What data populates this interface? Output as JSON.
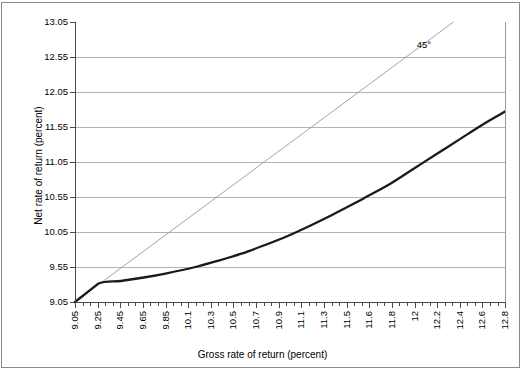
{
  "chart_data": {
    "type": "line",
    "title": "",
    "xlabel": "Gross rate of return (percent)",
    "ylabel": "Net rate of return (percent)",
    "xlim": [
      9.05,
      12.8
    ],
    "ylim": [
      9.05,
      13.05
    ],
    "grid": true,
    "legend": "none",
    "x_tick_labels": [
      "9.05",
      "9.25",
      "9.45",
      "9.65",
      "9.85",
      "10.1",
      "10.3",
      "10.5",
      "10.7",
      "10.9",
      "11.1",
      "11.3",
      "11.5",
      "11.6",
      "11.8",
      "12",
      "12.2",
      "12.4",
      "12.6",
      "12.8"
    ],
    "y_tick_labels": [
      "9.05",
      "9.55",
      "10.05",
      "10.55",
      "11.05",
      "11.55",
      "12.05",
      "12.55",
      "13.05"
    ],
    "annotations": [
      {
        "text": "45°",
        "x": 12.03,
        "y": 12.72,
        "name": "forty-five-degree-label"
      }
    ],
    "series": [
      {
        "name": "45-degree reference line",
        "style": "thin-gray",
        "color": "#9a9a9a",
        "x": [
          9.05,
          12.35
        ],
        "y": [
          9.05,
          13.05
        ]
      },
      {
        "name": "Net rate of return curve",
        "style": "thick-black",
        "color": "#1a1a1a",
        "x": [
          9.05,
          9.25,
          9.45,
          9.65,
          9.85,
          10.1,
          10.3,
          10.5,
          10.7,
          10.9,
          11.1,
          11.3,
          11.5,
          11.6,
          11.8,
          12.0,
          12.2,
          12.4,
          12.6,
          12.8
        ],
        "y": [
          9.05,
          9.31,
          9.35,
          9.4,
          9.46,
          9.55,
          9.64,
          9.74,
          9.86,
          9.99,
          10.14,
          10.3,
          10.47,
          10.56,
          10.74,
          10.95,
          11.16,
          11.37,
          11.58,
          11.77
        ]
      }
    ]
  },
  "axis": {
    "x_title": "Gross rate of return (percent)",
    "y_title": "Net rate of return (percent)"
  }
}
